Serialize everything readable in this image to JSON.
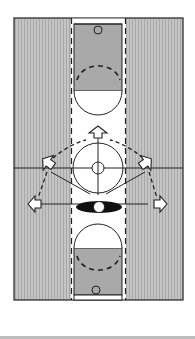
{
  "diagram": {
    "title": "Basketball half-court diagram: center circle offensive set with arrow movements",
    "colors": {
      "sideline_fill": "#b8b8b8",
      "sideline_stripe": "#d6d6d6",
      "key_fill": "#a9a9a9",
      "lane_fill": "#ffffff",
      "stroke": "#222222",
      "player_oval": "#111111",
      "bottom_rule": "#bdbdbd"
    },
    "elements": {
      "court": "court outline",
      "center_line": "midcourt line",
      "center_circle": "center circle",
      "inner_circle": "center jump circle",
      "top_key": "top free-throw lane with basket",
      "bottom_key": "bottom free-throw lane with basket",
      "players": [
        {
          "id": "top",
          "label": "arrow player top"
        },
        {
          "id": "left-upper",
          "label": "arrow player left upper"
        },
        {
          "id": "right-upper",
          "label": "arrow player right upper"
        },
        {
          "id": "left-lower",
          "label": "arrow player left lower"
        },
        {
          "id": "right-lower",
          "label": "arrow player right lower"
        },
        {
          "id": "center",
          "label": "ball handler oval"
        }
      ]
    }
  }
}
